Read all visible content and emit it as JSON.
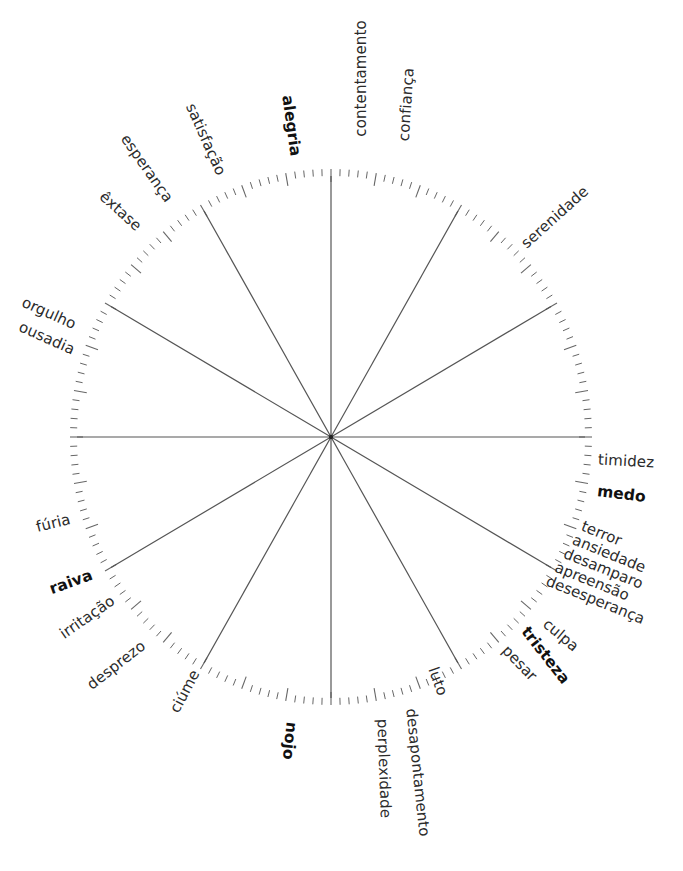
{
  "diagram": {
    "title": "",
    "type": "emotion-wheel",
    "center": {
      "x": 331,
      "y": 437
    },
    "radius": {
      "rx": 254,
      "ry": 261
    },
    "spoke_count": 12,
    "spoke_angle_step_deg": 30,
    "colors": {
      "line": "#555555",
      "tick": "#666666",
      "text": "#2b2b2b",
      "primary_text": "#111111"
    }
  },
  "primary_emotions": [
    "alegria",
    "medo",
    "tristeza",
    "nojo",
    "raiva"
  ],
  "labels": {
    "contentamento": "contentamento",
    "confianca": "confiança",
    "alegria": "alegria",
    "satisfacao": "satisfação",
    "esperanca": "esperança",
    "extase": "êxtase",
    "orgulho": "orgulho",
    "ousadia": "ousadia",
    "serenidade": "serenidade",
    "timidez": "timidez",
    "medo": "medo",
    "terror": "terror",
    "ansiedade": "ansiedade",
    "desamparo": "desamparo",
    "apreensao": "apreensão",
    "desesperanca": "desesperança",
    "culpa": "culpa",
    "tristeza": "tristeza",
    "pesar": "pesar",
    "luto": "luto",
    "desapontamento": "desapontamento",
    "perplexidade": "perplexidade",
    "nojo": "nojo",
    "ciume": "ciúme",
    "desprezo": "desprezo",
    "irritacao": "irritação",
    "raiva": "raiva",
    "furia": "fúria"
  }
}
